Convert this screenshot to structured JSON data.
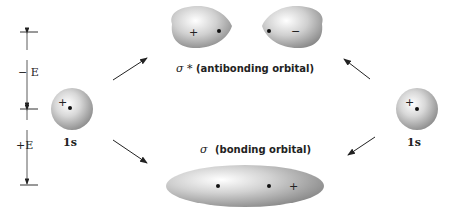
{
  "diagram": {
    "energy_scale": {
      "upper_label": "− E",
      "lower_label": "+E"
    },
    "left_atom": {
      "label": "1s",
      "sign": "+"
    },
    "right_atom": {
      "label": "1s",
      "sign": "+"
    },
    "antibonding": {
      "symbol": "σ *",
      "label": "(antibonding orbital)",
      "left_sign": "+",
      "right_sign": "−"
    },
    "bonding": {
      "symbol": "σ",
      "label": "(bonding orbital)",
      "sign": "+"
    }
  }
}
